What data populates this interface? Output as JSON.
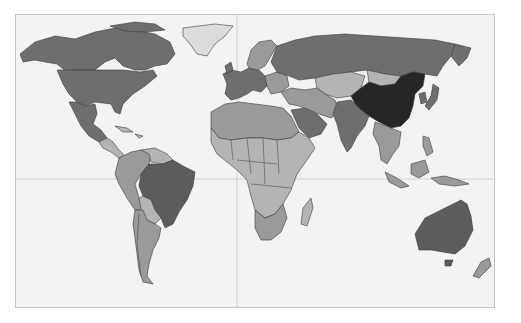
{
  "map": {
    "type": "choropleth",
    "projection": "equirectangular-like world map",
    "palette": {
      "ocean": "#f3f3f3",
      "frame": "#c4c4c4",
      "gridline": "#c8c8c8",
      "border": "#3a3a3a",
      "level_0_lightest": "#dcdcdc",
      "level_1_light": "#b4b4b4",
      "level_2_mid": "#9a9a9a",
      "level_3_dark": "#6e6e6e",
      "level_4_darker": "#5c5c5c",
      "level_5_darkest": "#262626"
    },
    "regions": [
      {
        "name": "Canada",
        "shade": "level_3_dark"
      },
      {
        "name": "United States",
        "shade": "level_3_dark"
      },
      {
        "name": "Mexico",
        "shade": "level_3_dark"
      },
      {
        "name": "Greenland",
        "shade": "level_0_lightest"
      },
      {
        "name": "Central America",
        "shade": "level_1_light"
      },
      {
        "name": "Caribbean",
        "shade": "level_1_light"
      },
      {
        "name": "Brazil",
        "shade": "level_3_dark"
      },
      {
        "name": "Western South America",
        "shade": "level_2_mid"
      },
      {
        "name": "Bolivia/Paraguay",
        "shade": "level_1_light"
      },
      {
        "name": "Argentina/Chile",
        "shade": "level_2_mid"
      },
      {
        "name": "Western Europe",
        "shade": "level_3_dark"
      },
      {
        "name": "Scandinavia",
        "shade": "level_2_mid"
      },
      {
        "name": "Russia",
        "shade": "level_3_dark"
      },
      {
        "name": "Central Asia",
        "shade": "level_1_light"
      },
      {
        "name": "Mongolia",
        "shade": "level_1_light"
      },
      {
        "name": "China",
        "shade": "level_5_darkest"
      },
      {
        "name": "India",
        "shade": "level_3_dark"
      },
      {
        "name": "Middle East",
        "shade": "level_2_mid"
      },
      {
        "name": "Saudi Arabia",
        "shade": "level_3_dark"
      },
      {
        "name": "Southeast Asia",
        "shade": "level_2_mid"
      },
      {
        "name": "Japan/Korea",
        "shade": "level_3_dark"
      },
      {
        "name": "Indonesia",
        "shade": "level_2_mid"
      },
      {
        "name": "North Africa",
        "shade": "level_2_mid"
      },
      {
        "name": "Sub-Saharan Africa",
        "shade": "level_1_light"
      },
      {
        "name": "Southern Africa",
        "shade": "level_2_mid"
      },
      {
        "name": "Madagascar",
        "shade": "level_1_light"
      },
      {
        "name": "Australia",
        "shade": "level_3_dark"
      },
      {
        "name": "New Zealand",
        "shade": "level_2_mid"
      }
    ],
    "gridlines": {
      "equator_y": 179,
      "prime_meridian_x": 237
    },
    "frame": {
      "left": 15,
      "top": 14,
      "right": 495,
      "bottom": 308
    }
  }
}
